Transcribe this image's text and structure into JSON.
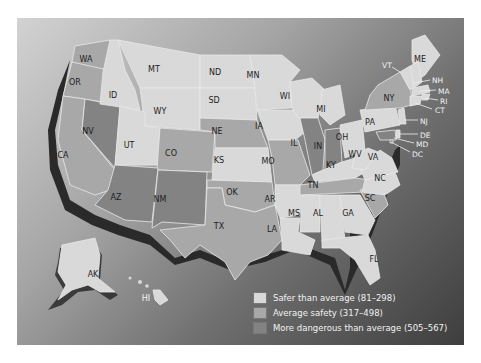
{
  "map": {
    "title": "",
    "states": [
      {
        "abbr": "WA",
        "category": "avg"
      },
      {
        "abbr": "OR",
        "category": "avg"
      },
      {
        "abbr": "CA",
        "category": "avg"
      },
      {
        "abbr": "ID",
        "category": "safe"
      },
      {
        "abbr": "MT",
        "category": "safe"
      },
      {
        "abbr": "WY",
        "category": "safe"
      },
      {
        "abbr": "NV",
        "category": "dang"
      },
      {
        "abbr": "UT",
        "category": "safe"
      },
      {
        "abbr": "CO",
        "category": "avg"
      },
      {
        "abbr": "AZ",
        "category": "dang"
      },
      {
        "abbr": "NM",
        "category": "dang"
      },
      {
        "abbr": "ND",
        "category": "safe"
      },
      {
        "abbr": "SD",
        "category": "safe"
      },
      {
        "abbr": "NE",
        "category": "avg"
      },
      {
        "abbr": "KS",
        "category": "safe"
      },
      {
        "abbr": "OK",
        "category": "avg"
      },
      {
        "abbr": "TX",
        "category": "avg"
      },
      {
        "abbr": "MN",
        "category": "safe"
      },
      {
        "abbr": "IA",
        "category": "safe"
      },
      {
        "abbr": "MO",
        "category": "avg"
      },
      {
        "abbr": "AR",
        "category": "safe"
      },
      {
        "abbr": "LA",
        "category": "safe"
      },
      {
        "abbr": "WI",
        "category": "safe"
      },
      {
        "abbr": "IL",
        "category": "dang"
      },
      {
        "abbr": "MI",
        "category": "safe"
      },
      {
        "abbr": "IN",
        "category": "dang"
      },
      {
        "abbr": "OH",
        "category": "safe"
      },
      {
        "abbr": "KY",
        "category": "safe"
      },
      {
        "abbr": "TN",
        "category": "avg"
      },
      {
        "abbr": "MS",
        "category": "safe"
      },
      {
        "abbr": "AL",
        "category": "safe"
      },
      {
        "abbr": "GA",
        "category": "safe"
      },
      {
        "abbr": "FL",
        "category": "safe"
      },
      {
        "abbr": "SC",
        "category": "avg"
      },
      {
        "abbr": "NC",
        "category": "safe"
      },
      {
        "abbr": "VA",
        "category": "safe"
      },
      {
        "abbr": "WV",
        "category": "safe"
      },
      {
        "abbr": "PA",
        "category": "safe"
      },
      {
        "abbr": "NY",
        "category": "avg"
      },
      {
        "abbr": "VT",
        "category": "safe"
      },
      {
        "abbr": "ME",
        "category": "safe"
      },
      {
        "abbr": "NH",
        "category": "safe"
      },
      {
        "abbr": "MA",
        "category": "safe"
      },
      {
        "abbr": "RI",
        "category": "safe"
      },
      {
        "abbr": "CT",
        "category": "safe"
      },
      {
        "abbr": "NJ",
        "category": "safe"
      },
      {
        "abbr": "DE",
        "category": "safe"
      },
      {
        "abbr": "MD",
        "category": "dang"
      },
      {
        "abbr": "DC",
        "category": "dang"
      },
      {
        "abbr": "AK",
        "category": "safe"
      },
      {
        "abbr": "HI",
        "category": "safe"
      }
    ]
  },
  "labels": {
    "WA": "WA",
    "OR": "OR",
    "CA": "CA",
    "ID": "ID",
    "MT": "MT",
    "WY": "WY",
    "NV": "NV",
    "UT": "UT",
    "CO": "CO",
    "AZ": "AZ",
    "NM": "NM",
    "ND": "ND",
    "SD": "SD",
    "NE": "NE",
    "KS": "KS",
    "OK": "OK",
    "TX": "TX",
    "MN": "MN",
    "IA": "IA",
    "MO": "MO",
    "AR": "AR",
    "LA": "LA",
    "WI": "WI",
    "IL": "IL",
    "MI": "MI",
    "IN": "IN",
    "OH": "OH",
    "KY": "KY",
    "TN": "TN",
    "MS": "MS",
    "AL": "AL",
    "GA": "GA",
    "FL": "FL",
    "SC": "SC",
    "NC": "NC",
    "VA": "VA",
    "WV": "WV",
    "PA": "PA",
    "NY": "NY",
    "VT": "VT",
    "ME": "ME",
    "NH": "NH",
    "MA": "MA",
    "RI": "RI",
    "CT": "CT",
    "NJ": "NJ",
    "DE": "DE",
    "MD": "MD",
    "DC": "DC",
    "AK": "AK",
    "HI": "HI"
  },
  "legend": {
    "items": [
      {
        "label": "Safer than average (81–298)",
        "color": "#d9d9d9"
      },
      {
        "label": "Average safety (317–498)",
        "color": "#a8a8a8"
      },
      {
        "label": "More dangerous than average (505–567)",
        "color": "#838383"
      }
    ]
  },
  "colors": {
    "safe": "#d9d9d9",
    "average": "#a8a8a8",
    "dangerous": "#838383",
    "coast_shadow": "#2a2a2a"
  }
}
